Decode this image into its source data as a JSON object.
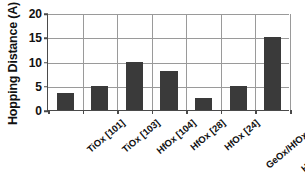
{
  "chart_data": {
    "type": "bar",
    "title": "",
    "xlabel": "",
    "ylabel": "Hopping Distance (A)",
    "ylim": [
      0,
      20
    ],
    "yticks": [
      0,
      5,
      10,
      15,
      20
    ],
    "grid": true,
    "legend": false,
    "bar_color": "#3a3a3a",
    "categories": [
      "TiOx [101]",
      "TiOx [103]",
      "HfOx [104]",
      "HfOx [28]",
      "HfOx [24]",
      "GeOx/HfOx [94]",
      "HRS of WOx [65]"
    ],
    "values": [
      3.5,
      5,
      10,
      8,
      2.5,
      5,
      15
    ]
  },
  "axes": {
    "y_title": "Hopping Distance (A)",
    "y_tick_labels": [
      "0",
      "5",
      "10",
      "15",
      "20"
    ]
  }
}
